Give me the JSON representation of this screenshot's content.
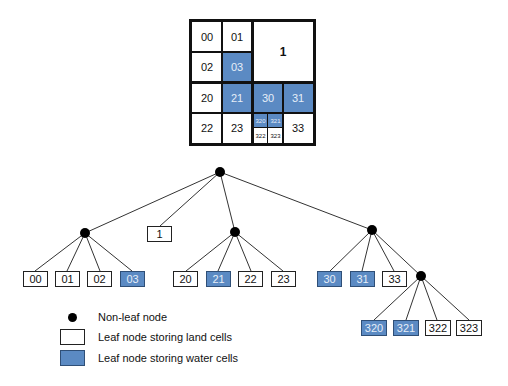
{
  "grid": {
    "cells": {
      "c00": "00",
      "c01": "01",
      "c02": "02",
      "c03": "03",
      "c1": "1",
      "c20": "20",
      "c21": "21",
      "c22": "22",
      "c23": "23",
      "c30": "30",
      "c31": "31",
      "c33": "33",
      "c320": "320",
      "c321": "321",
      "c322": "322",
      "c323": "323"
    },
    "water_cells": [
      "03",
      "21",
      "30",
      "31",
      "320",
      "321"
    ]
  },
  "tree": {
    "root": "root",
    "nodes": [
      {
        "id": "root",
        "type": "non-leaf",
        "children": [
          "0",
          "1",
          "2",
          "3"
        ]
      },
      {
        "id": "0",
        "type": "non-leaf",
        "children": [
          "00",
          "01",
          "02",
          "03"
        ]
      },
      {
        "id": "2",
        "type": "non-leaf",
        "children": [
          "20",
          "21",
          "22",
          "23"
        ]
      },
      {
        "id": "3",
        "type": "non-leaf",
        "children": [
          "30",
          "31",
          "32",
          "33"
        ]
      },
      {
        "id": "32",
        "type": "non-leaf",
        "children": [
          "320",
          "321",
          "322",
          "323"
        ]
      }
    ],
    "leaves": {
      "l1": "1",
      "l00": "00",
      "l01": "01",
      "l02": "02",
      "l03": "03",
      "l20": "20",
      "l21": "21",
      "l22": "22",
      "l23": "23",
      "l30": "30",
      "l31": "31",
      "l33": "33",
      "l320": "320",
      "l321": "321",
      "l322": "322",
      "l323": "323"
    }
  },
  "legend": {
    "non_leaf": "Non-leaf node",
    "land": "Leaf node storing land cells",
    "water": "Leaf node storing water cells"
  },
  "colors": {
    "water": "#5b8ac3",
    "land": "#ffffff",
    "line": "#111111"
  }
}
